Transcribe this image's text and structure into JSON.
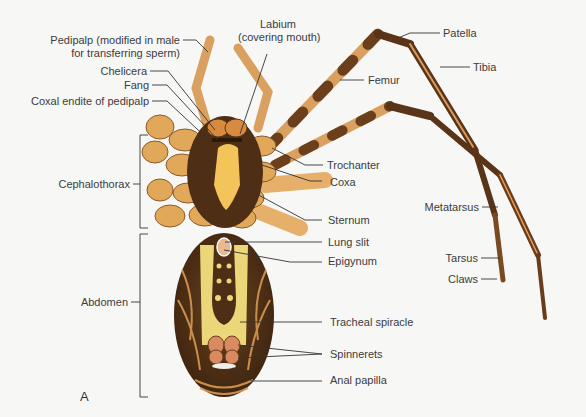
{
  "figure": {
    "panel_letter": "A"
  },
  "labels_left": [
    {
      "id": "pedipalp",
      "text_line1": "Pedipalp (modified in male",
      "text_line2": "for transferring sperm)"
    },
    {
      "id": "chelicera",
      "text": "Chelicera"
    },
    {
      "id": "fang",
      "text": "Fang"
    },
    {
      "id": "coxal_endite",
      "text": "Coxal endite of pedipalp"
    }
  ],
  "labels_top": [
    {
      "id": "labium",
      "text_line1": "Labium",
      "text_line2": "(covering mouth)"
    }
  ],
  "labels_right": [
    {
      "id": "patella",
      "text": "Patella"
    },
    {
      "id": "tibia",
      "text": "Tibia"
    },
    {
      "id": "femur",
      "text": "Femur"
    },
    {
      "id": "trochanter",
      "text": "Trochanter"
    },
    {
      "id": "coxa",
      "text": "Coxa"
    },
    {
      "id": "sternum",
      "text": "Sternum"
    },
    {
      "id": "metatarsus",
      "text": "Metatarsus"
    },
    {
      "id": "lung_slit",
      "text": "Lung slit"
    },
    {
      "id": "epigynum",
      "text": "Epigynum"
    },
    {
      "id": "tarsus",
      "text": "Tarsus"
    },
    {
      "id": "claws",
      "text": "Claws"
    },
    {
      "id": "tracheal_spiracle",
      "text": "Tracheal spiracle"
    },
    {
      "id": "spinnerets",
      "text": "Spinnerets"
    },
    {
      "id": "anal_papilla",
      "text": "Anal papilla"
    }
  ],
  "brackets": [
    {
      "id": "cephalothorax",
      "text": "Cephalothorax"
    },
    {
      "id": "abdomen",
      "text": "Abdomen"
    }
  ],
  "colors": {
    "background": "#f7f7f6",
    "leg_light": "#e2a85a",
    "leg_dark": "#5a3418",
    "sternum": "#f2c45a",
    "abdomen_dark": "#4a2c14",
    "abdomen_stripe": "#e9d27a",
    "leader_line": "#333333"
  }
}
